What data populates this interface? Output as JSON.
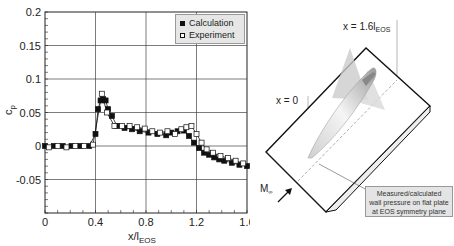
{
  "chart_data": {
    "type": "line",
    "title": "",
    "xlabel": "x/l_EOS",
    "ylabel": "c_p",
    "xlim": [
      0,
      1.6
    ],
    "ylim": [
      -0.1,
      0.2
    ],
    "grid": true,
    "legend_position": "upper right",
    "x_ticks": [
      "0",
      "0.4",
      "0.8",
      "1.2",
      "1.6"
    ],
    "y_ticks": [
      "0.2",
      "0.15",
      "0.1",
      "0.05",
      "0",
      "-0.05"
    ],
    "series": [
      {
        "name": "Calculation",
        "marker": "filled-square",
        "x": [
          0.0,
          0.07,
          0.14,
          0.21,
          0.28,
          0.35,
          0.4,
          0.42,
          0.44,
          0.46,
          0.48,
          0.5,
          0.53,
          0.57,
          0.63,
          0.69,
          0.75,
          0.82,
          0.89,
          0.96,
          1.0,
          1.05,
          1.1,
          1.14,
          1.18,
          1.22,
          1.26,
          1.3,
          1.34,
          1.38,
          1.42,
          1.48,
          1.54,
          1.6
        ],
        "y": [
          0.0,
          0.0,
          0.0,
          0.0,
          0.0,
          0.0,
          0.018,
          0.055,
          0.068,
          0.07,
          0.068,
          0.055,
          0.045,
          0.03,
          0.027,
          0.025,
          0.022,
          0.02,
          0.018,
          0.016,
          0.02,
          0.022,
          0.023,
          0.015,
          0.005,
          -0.003,
          -0.01,
          -0.013,
          -0.017,
          -0.02,
          -0.022,
          -0.025,
          -0.028,
          -0.03
        ]
      },
      {
        "name": "Experiment",
        "marker": "open-square",
        "x": [
          0.03,
          0.1,
          0.17,
          0.24,
          0.31,
          0.38,
          0.45,
          0.49,
          0.55,
          0.61,
          0.67,
          0.73,
          0.79,
          0.85,
          0.91,
          0.97,
          1.03,
          1.08,
          1.12,
          1.16,
          1.2,
          1.24,
          1.28,
          1.33,
          1.39,
          1.45,
          1.51,
          1.57
        ],
        "y": [
          -0.002,
          0.0,
          -0.002,
          0.0,
          0.0,
          0.002,
          0.078,
          0.05,
          0.03,
          0.03,
          0.03,
          0.028,
          0.026,
          0.022,
          0.02,
          0.022,
          0.018,
          0.025,
          0.028,
          0.03,
          0.018,
          0.005,
          -0.005,
          -0.01,
          -0.015,
          -0.018,
          -0.022,
          -0.026
        ]
      }
    ]
  },
  "chart": {
    "legend": {
      "calc": "Calculation",
      "exp": "Experiment"
    },
    "ylabel": "c",
    "ylabel_sub": "p",
    "xlabel": "x/l",
    "xlabel_sub": "EOS",
    "yticks": [
      "0.2",
      "0.15",
      "0.1",
      "0.05",
      "0",
      "-0.05"
    ],
    "xticks": [
      "0",
      "0.4",
      "0.8",
      "1.2",
      "1.6"
    ]
  },
  "diagram": {
    "label_x_end": "x = 1.6l",
    "label_x_end_sub": "EOS",
    "label_x_start": "x = 0",
    "mach_label": "M",
    "mach_sub": "∞",
    "callout_line1": "Measured/calculated",
    "callout_line2": "wall pressure on flat plate",
    "callout_line3": "at EOS symmetry plane"
  }
}
